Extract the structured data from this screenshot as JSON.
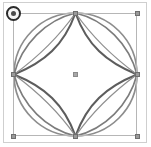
{
  "app": {
    "title": "Vector Shape Selection",
    "canvas_background": "#ffffff",
    "frame_border_color": "#cfcfcf"
  },
  "artwork": {
    "name": "circle-star-petal-figure",
    "description": "Circle containing a four-pointed concave star (astroid) and four petal curves joining the cardinal points",
    "stroke_color": "#707070",
    "stroke_color_dark": "#595959",
    "stroke_color_light": "#8d8d8d",
    "fill": "none",
    "center": {
      "x": 75.5,
      "y": 74.5
    },
    "radius": 62,
    "paths": [
      {
        "name": "outer-circle",
        "stroke": "#8d8d8d",
        "width": 1.6
      },
      {
        "name": "astroid-top-left",
        "stroke": "#5f5f5f",
        "width": 2.0
      },
      {
        "name": "astroid-top-right",
        "stroke": "#5f5f5f",
        "width": 2.0
      },
      {
        "name": "astroid-bottom-right",
        "stroke": "#5f5f5f",
        "width": 2.0
      },
      {
        "name": "astroid-bottom-left",
        "stroke": "#5f5f5f",
        "width": 2.0
      },
      {
        "name": "petal-top-left",
        "stroke": "#7d7d7d",
        "width": 1.5
      },
      {
        "name": "petal-top-right",
        "stroke": "#7d7d7d",
        "width": 1.5
      },
      {
        "name": "petal-bottom-right",
        "stroke": "#7d7d7d",
        "width": 1.5
      },
      {
        "name": "petal-bottom-left",
        "stroke": "#7d7d7d",
        "width": 1.5
      }
    ]
  },
  "selection": {
    "name": "selection-bounding-box",
    "border_color": "#b6b6b6",
    "handle_fill": "#9a9a9a",
    "handle_border": "#6f6f6f",
    "bounds": {
      "x": 13,
      "y": 13,
      "width": 124,
      "height": 123
    },
    "handles": [
      {
        "name": "handle-top-left",
        "x": 13,
        "y": 13
      },
      {
        "name": "handle-top-center",
        "x": 75,
        "y": 13
      },
      {
        "name": "handle-top-right",
        "x": 137,
        "y": 13
      },
      {
        "name": "handle-middle-left",
        "x": 13,
        "y": 74
      },
      {
        "name": "handle-middle-right",
        "x": 137,
        "y": 74
      },
      {
        "name": "handle-bottom-left",
        "x": 13,
        "y": 136
      },
      {
        "name": "handle-bottom-center",
        "x": 75,
        "y": 136
      },
      {
        "name": "handle-bottom-right",
        "x": 137,
        "y": 136
      }
    ],
    "center_marker": {
      "name": "center-pivot-marker",
      "x": 75,
      "y": 74
    },
    "rotate_handle": {
      "name": "rotate-handle",
      "x": 13,
      "y": 13,
      "ring_color": "#2b2b2b",
      "inner_color": "#f4f4f4",
      "dot_color": "#4a4a4a"
    }
  }
}
